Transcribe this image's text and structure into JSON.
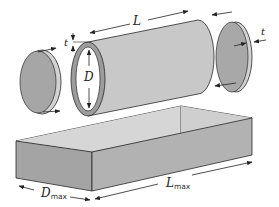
{
  "diagram": {
    "type": "exploded-view",
    "components": [
      {
        "name": "left-end-cap",
        "label": "t"
      },
      {
        "name": "cylinder-tube",
        "labels": [
          "L",
          "D",
          "t"
        ]
      },
      {
        "name": "right-end-cap",
        "label": "t"
      },
      {
        "name": "rectangular-box",
        "labels": [
          "D",
          "L"
        ]
      }
    ]
  },
  "labels": {
    "length": "L",
    "diameter": "D",
    "thickness_tube": "t",
    "thickness_right_cap": "t",
    "box_width_main": "D",
    "box_width_sub": "max",
    "box_length_main": "L",
    "box_length_sub": "max"
  },
  "colors": {
    "cap_fill": "#a8a8a8",
    "cap_rim": "#d2d2d2",
    "tube_fill": "#c8c8c8",
    "tube_ring": "#9a9a9a",
    "box_top": "#dcdcdc",
    "box_front": "#a4a4a4",
    "box_side": "#b4b4b4",
    "stroke": "#2a2a2a"
  }
}
